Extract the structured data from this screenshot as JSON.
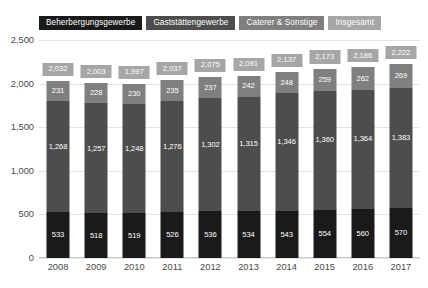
{
  "chart_data": {
    "type": "bar",
    "subtype": "stacked-vertical",
    "title": "",
    "xlabel": "",
    "ylabel": "",
    "ylim": [
      0,
      2500
    ],
    "yticks": [
      "0",
      "500",
      "1,000",
      "1,500",
      "2,000",
      "2,500"
    ],
    "ytick_values": [
      0,
      500,
      1000,
      1500,
      2000,
      2500
    ],
    "grid": true,
    "legend_position": "top",
    "categories": [
      "2008",
      "2009",
      "2010",
      "2011",
      "2012",
      "2013",
      "2014",
      "2015",
      "2016",
      "2017"
    ],
    "series": [
      {
        "name": "Beherbergungsgewerbe",
        "color": "#1a1a1a",
        "values": [
          533,
          518,
          519,
          526,
          536,
          534,
          543,
          554,
          560,
          570
        ],
        "labels": [
          "533",
          "518",
          "519",
          "526",
          "536",
          "534",
          "543",
          "554",
          "560",
          "570"
        ]
      },
      {
        "name": "Gaststättengewerbe",
        "color": "#4d4d4d",
        "values": [
          1268,
          1257,
          1248,
          1276,
          1302,
          1315,
          1346,
          1360,
          1364,
          1383
        ],
        "labels": [
          "1,268",
          "1,257",
          "1,248",
          "1,276",
          "1,302",
          "1,315",
          "1,346",
          "1,360",
          "1,364",
          "1,383"
        ]
      },
      {
        "name": "Caterer & Sonstige",
        "color": "#7f7f7f",
        "values": [
          231,
          228,
          230,
          235,
          237,
          242,
          248,
          259,
          262,
          269
        ],
        "labels": [
          "231",
          "228",
          "230",
          "235",
          "237",
          "242",
          "248",
          "259",
          "262",
          "269"
        ]
      }
    ],
    "totals": {
      "name": "Insgesamt",
      "color": "#a6a6a6",
      "values": [
        2032,
        2003,
        1997,
        2037,
        2075,
        2091,
        2137,
        2173,
        2186,
        2222
      ],
      "labels": [
        "2,032",
        "2,003",
        "1,997",
        "2,037",
        "2,075",
        "2,091",
        "2,137",
        "2,173",
        "2,186",
        "2,222"
      ]
    }
  },
  "legend": {
    "items": [
      {
        "label": "Beherbergungsgewerbe",
        "color": "#1a1a1a"
      },
      {
        "label": "Gaststättengewerbe",
        "color": "#4d4d4d"
      },
      {
        "label": "Caterer & Sonstige",
        "color": "#7f7f7f"
      },
      {
        "label": "Insgesamt",
        "color": "#a6a6a6"
      }
    ]
  }
}
